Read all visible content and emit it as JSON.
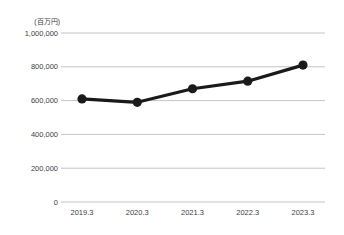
{
  "chart_data": {
    "type": "line",
    "title": "",
    "subtitle": "",
    "unit_label": "(百万円)",
    "xlabel": "",
    "ylabel": "",
    "categories": [
      "2019.3",
      "2020.3",
      "2021.3",
      "2022.3",
      "2023.3"
    ],
    "series": [
      {
        "name": "value",
        "values": [
          610000,
          590000,
          670000,
          715000,
          810000
        ]
      }
    ],
    "ylim": [
      0,
      1000000
    ],
    "yticks": [
      0,
      200000,
      400000,
      600000,
      800000,
      1000000
    ],
    "ytick_labels": [
      "0",
      "200,000",
      "400,000",
      "600,000",
      "800,000",
      "1,000,000"
    ],
    "grid": "horizontal",
    "legend": "none",
    "colors": {
      "line": "#1a1a1a",
      "marker": "#1a1a1a",
      "gridline": "#b0b0b0",
      "text": "#404040",
      "background": "#ffffff"
    }
  }
}
